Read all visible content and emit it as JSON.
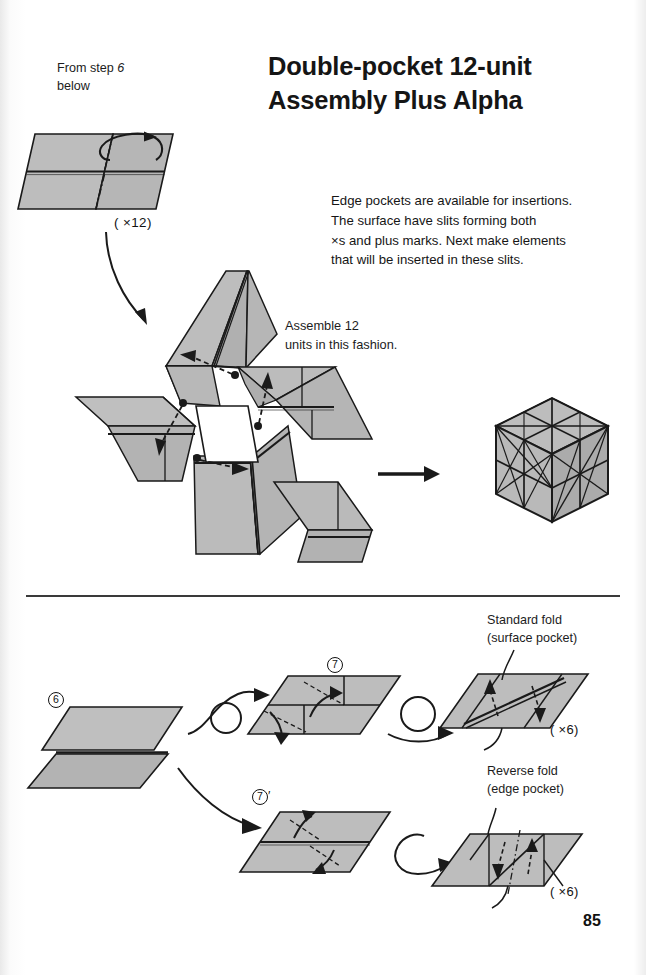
{
  "page": {
    "number": "85",
    "title_line1": "Double-pocket 12-unit",
    "title_line2": "Assembly Plus Alpha"
  },
  "top_section": {
    "from_step_label_line1": "From step",
    "from_step_label_italic": "6",
    "from_step_label_line2": "below",
    "unit_multiplier": "( ×12)",
    "assemble_note_line1": "Assemble 12",
    "assemble_note_line2": "units in this fashion.",
    "description": [
      "Edge pockets are available for insertions.",
      "The surface have slits forming both",
      " ×s and plus marks. Next make elements",
      "that will be inserted in these slits."
    ]
  },
  "bottom_section": {
    "step6_label": "6",
    "step7_label": "7",
    "step7prime_label": "7",
    "step7prime_mark": "′",
    "standard_fold_line1": "Standard fold",
    "standard_fold_line2": "(surface pocket)",
    "reverse_fold_line1": "Reverse fold",
    "reverse_fold_line2": "(edge pocket)",
    "standard_multiplier": "( ×6)",
    "reverse_multiplier": "( ×6)"
  },
  "colors": {
    "paper_fill": "#b9b9b9",
    "paper_fill_light": "#c7c7c7",
    "paper_fill_dark": "#a9a9a9",
    "outline": "#1a1a1a",
    "page_background": "#ffffff",
    "rule": "#3a3a3a",
    "white_core": "#ffffff"
  },
  "icons": {
    "rotate_arrow": "rotate-arrow-icon",
    "curved_arrow": "curved-arrow-icon",
    "straight_arrow": "straight-arrow-icon",
    "dashed_insert_arrow": "dashed-insert-arrow-icon",
    "turn_over_loop": "turn-over-loop-icon"
  }
}
